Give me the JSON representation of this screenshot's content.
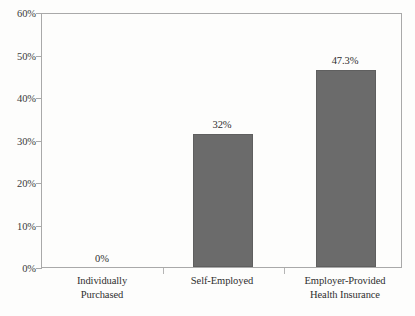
{
  "chart_data": {
    "type": "bar",
    "title": "",
    "subtitle": "",
    "xlabel": "",
    "ylabel": "",
    "categories": [
      "Individually Purchased",
      "Self-Employed",
      "Employer-Provided Health Insurance"
    ],
    "category_lines": [
      [
        "Individually",
        "Purchased"
      ],
      [
        "Self-Employed",
        ""
      ],
      [
        "Employer-Provided",
        "Health Insurance"
      ]
    ],
    "values": [
      0,
      31.5,
      46.7
    ],
    "data_labels": [
      "0%",
      "32%",
      "47.3%"
    ],
    "ylim": [
      0,
      60
    ],
    "ytick_values": [
      0,
      10,
      20,
      30,
      40,
      50,
      60
    ],
    "ytick_labels": [
      "0%",
      "10%",
      "20%",
      "30%",
      "40%",
      "50%",
      "60%"
    ],
    "grid": false,
    "legend": "none",
    "bar_color": "#6b6b6b",
    "bar_edge_color": "#5f5f5f",
    "axis_color": "#a9a9a9",
    "text_color": "#2f2f2f",
    "background_color": "#fdfdfc"
  }
}
